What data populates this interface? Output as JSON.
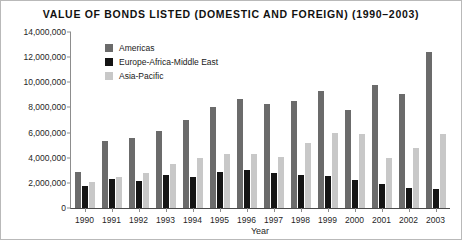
{
  "chart_data": {
    "type": "bar",
    "title": "VALUE OF BONDS LISTED (DOMESTIC AND FOREIGN) (1990–2003)",
    "xlabel": "Year",
    "ylabel": "US dollars (millions)",
    "categories": [
      "1990",
      "1991",
      "1992",
      "1993",
      "1994",
      "1995",
      "1996",
      "1997",
      "1998",
      "1999",
      "2000",
      "2001",
      "2002",
      "2003"
    ],
    "ylim": [
      0,
      14000000
    ],
    "ytick_step": 2000000,
    "ytick_labels": [
      "0",
      "2,000,000",
      "4,000,000",
      "6,000,000",
      "8,000,000",
      "10,000,000",
      "12,000,000",
      "14,000,000"
    ],
    "grid": false,
    "legend_position": "upper-left-inside",
    "series": [
      {
        "name": "Americas",
        "color": "#6b6b6b",
        "values": [
          2900000,
          5300000,
          5600000,
          6100000,
          7000000,
          8000000,
          8700000,
          8300000,
          8500000,
          9300000,
          7800000,
          9800000,
          9050000,
          12400000
        ]
      },
      {
        "name": "Europe-Africa-Middle East",
        "color": "#141414",
        "values": [
          1750000,
          2300000,
          2150000,
          2600000,
          2450000,
          2850000,
          3000000,
          2750000,
          2650000,
          2550000,
          2250000,
          1900000,
          1600000,
          1500000
        ]
      },
      {
        "name": "Asia-Pacific",
        "color": "#c8c8c8",
        "values": [
          2100000,
          2500000,
          2750000,
          3500000,
          4000000,
          4300000,
          4300000,
          4050000,
          5150000,
          6000000,
          5850000,
          3950000,
          4800000,
          5850000
        ]
      }
    ]
  }
}
